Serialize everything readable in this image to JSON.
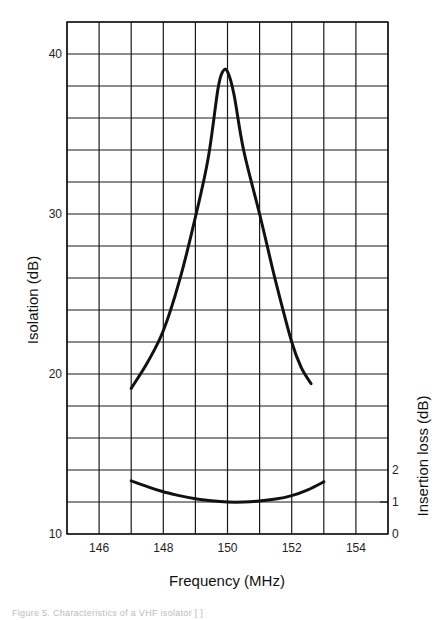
{
  "chart_data": {
    "type": "line",
    "title": "",
    "xlabel": "Frequency   (MHz)",
    "ylabel": "Isolation   (dB)",
    "y2label": "Insertion loss   (dB)",
    "xlim": [
      145,
      155
    ],
    "ylim": [
      10,
      42
    ],
    "y2lim": [
      0,
      16
    ],
    "grid": true,
    "x_ticks": [
      146,
      148,
      150,
      152,
      154
    ],
    "y_ticks": [
      10,
      20,
      30,
      40
    ],
    "y2_ticks": [
      0,
      1,
      2
    ],
    "x_grid_step": 1,
    "y_grid_step": 2,
    "series": [
      {
        "name": "Isolation",
        "axis": "left",
        "x": [
          147.0,
          147.5,
          148.0,
          148.5,
          149.0,
          149.4,
          149.7,
          149.85,
          150.0,
          150.2,
          150.5,
          151.0,
          151.5,
          152.0,
          152.3,
          152.6
        ],
        "y": [
          19.1,
          20.7,
          22.7,
          25.8,
          29.8,
          33.5,
          37.8,
          38.9,
          38.9,
          37.5,
          34.0,
          30.0,
          25.8,
          22.0,
          20.4,
          19.4
        ]
      },
      {
        "name": "Insertion loss",
        "axis": "right",
        "x": [
          147.0,
          147.5,
          148.0,
          148.5,
          149.0,
          149.5,
          150.0,
          150.5,
          151.0,
          151.5,
          152.0,
          152.5,
          153.0
        ],
        "y": [
          1.66,
          1.48,
          1.32,
          1.2,
          1.1,
          1.04,
          1.0,
          1.0,
          1.03,
          1.09,
          1.2,
          1.38,
          1.63
        ]
      }
    ]
  },
  "caption": "Figure 5.  Characteristics of a VHF isolator [ ]"
}
